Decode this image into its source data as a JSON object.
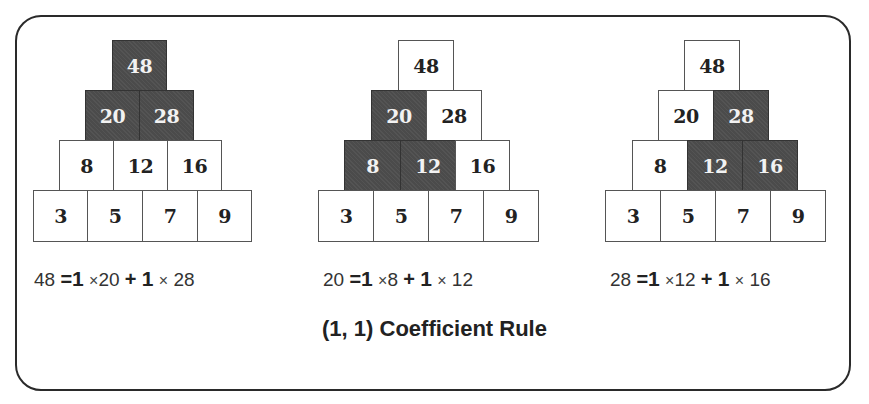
{
  "title": "(1, 1) Coefficient Rule",
  "colors": {
    "highlight_fill": "#4b4b4b",
    "highlight_text": "#f2f2f2",
    "cell_fill": "#ffffff",
    "cell_text": "#222222",
    "frame": "#2a2a2a"
  },
  "pyramids": [
    {
      "rows": [
        {
          "values": [
            "48"
          ],
          "highlighted": [
            true
          ]
        },
        {
          "values": [
            "20",
            "28"
          ],
          "highlighted": [
            true,
            true
          ]
        },
        {
          "values": [
            "8",
            "12",
            "16"
          ],
          "highlighted": [
            false,
            false,
            false
          ]
        },
        {
          "values": [
            "3",
            "5",
            "7",
            "9"
          ],
          "highlighted": [
            false,
            false,
            false,
            false
          ]
        }
      ],
      "equation": {
        "lhs": "48",
        "eq": "=",
        "c1": "1",
        "t1": "×",
        "a": "20",
        "plus": "+",
        "c2": "1",
        "t2": "×",
        "b": "28"
      }
    },
    {
      "rows": [
        {
          "values": [
            "48"
          ],
          "highlighted": [
            false
          ]
        },
        {
          "values": [
            "20",
            "28"
          ],
          "highlighted": [
            true,
            false
          ]
        },
        {
          "values": [
            "8",
            "12",
            "16"
          ],
          "highlighted": [
            true,
            true,
            false
          ]
        },
        {
          "values": [
            "3",
            "5",
            "7",
            "9"
          ],
          "highlighted": [
            false,
            false,
            false,
            false
          ]
        }
      ],
      "equation": {
        "lhs": "20",
        "eq": "=",
        "c1": "1",
        "t1": "×",
        "a": "8",
        "plus": "+",
        "c2": "1",
        "t2": "×",
        "b": "12"
      }
    },
    {
      "rows": [
        {
          "values": [
            "48"
          ],
          "highlighted": [
            false
          ]
        },
        {
          "values": [
            "20",
            "28"
          ],
          "highlighted": [
            false,
            true
          ]
        },
        {
          "values": [
            "8",
            "12",
            "16"
          ],
          "highlighted": [
            false,
            true,
            true
          ]
        },
        {
          "values": [
            "3",
            "5",
            "7",
            "9"
          ],
          "highlighted": [
            false,
            false,
            false,
            false
          ]
        }
      ],
      "equation": {
        "lhs": "28",
        "eq": "=",
        "c1": "1",
        "t1": "×",
        "a": "12",
        "plus": "+",
        "c2": "1",
        "t2": "×",
        "b": "16"
      }
    }
  ]
}
